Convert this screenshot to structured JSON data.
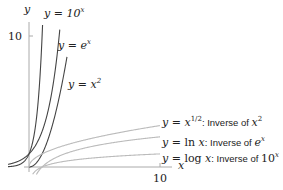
{
  "chart_data": {
    "type": "line",
    "title": "",
    "xlabel": "x",
    "ylabel": "y",
    "x_ticks": [
      10
    ],
    "y_ticks": [
      10
    ],
    "xlim": [
      0,
      11
    ],
    "ylim": [
      0,
      11.5
    ],
    "grid": false,
    "legend_position": "inline labels",
    "series": [
      {
        "name": "y = 10^x",
        "function": "10^x",
        "color": "#444444"
      },
      {
        "name": "y = e^x",
        "function": "exp(x)",
        "color": "#444444"
      },
      {
        "name": "y = x^2",
        "function": "x^2",
        "color": "#444444"
      },
      {
        "name": "y = x^{1/2}: Inverse of x^2",
        "function": "sqrt(x)",
        "color": "#bbbbbb"
      },
      {
        "name": "y = ln x: Inverse of e^x",
        "function": "ln(x)",
        "color": "#bbbbbb"
      },
      {
        "name": "y = log x: Inverse of 10^x",
        "function": "log10(x)",
        "color": "#bbbbbb"
      }
    ]
  },
  "labels": {
    "y_axis": "y",
    "x_axis": "x",
    "y_tick": "10",
    "x_tick": "10",
    "tenx": {
      "lhs": "y = 10",
      "sup": "x"
    },
    "ex": {
      "lhs": "y = e",
      "sup": "x"
    },
    "x2": {
      "lhs": "y = x",
      "sup": "2"
    },
    "sqrt": {
      "lhs": "y = x",
      "sup": "1/2",
      "note": ": Inverse of ",
      "target": "x",
      "target_sup": "2"
    },
    "ln": {
      "lhs": "y = ",
      "fn": "ln",
      "arg": " x",
      "note": ": Inverse of ",
      "target": "e",
      "target_sup": "x"
    },
    "log": {
      "lhs": "y = ",
      "fn": "log",
      "arg": " x",
      "note": ": Inverse of ",
      "target": "10",
      "target_sup": "x"
    }
  }
}
